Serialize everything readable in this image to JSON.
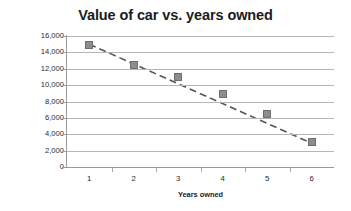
{
  "chart_data": {
    "type": "scatter",
    "title": "Value of car vs. years owned",
    "xlabel": "Years owned",
    "ylabel": "Value of car (in $)",
    "categories": [
      1,
      2,
      3,
      4,
      5,
      6
    ],
    "x_tick_labels": [
      "1",
      "2",
      "3",
      "4",
      "5",
      "6"
    ],
    "values": [
      14900,
      12400,
      11000,
      8900,
      6500,
      3000
    ],
    "series": [
      {
        "name": "Value of car",
        "values": [
          14900,
          12400,
          11000,
          8900,
          6500,
          3000
        ]
      }
    ],
    "trendline": {
      "style": "dashed",
      "color": "#555555",
      "from": [
        1,
        15000
      ],
      "to": [
        6,
        2900
      ]
    },
    "ylim": [
      0,
      16000
    ],
    "ytick_step": 2000,
    "y_tick_labels": [
      "16,000",
      "14,000",
      "12,000",
      "10,000",
      "8,000",
      "6,000",
      "4,000",
      "2,000",
      "0"
    ],
    "y_tick_values": [
      16000,
      14000,
      12000,
      10000,
      8000,
      6000,
      4000,
      2000,
      0
    ],
    "grid": "horizontal",
    "legend": "none",
    "marker_color": "#8d8d8d",
    "marker_shape": "square",
    "gridline_color": "#b6b6b6",
    "axis_color": "#9a9a9a",
    "title_color": "#1b1b1b",
    "background": "#ffffff"
  }
}
